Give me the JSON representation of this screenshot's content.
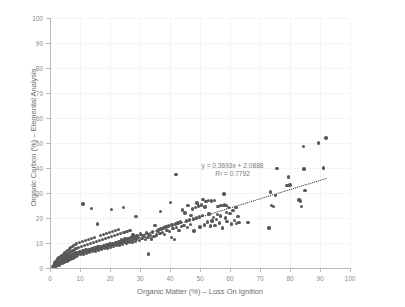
{
  "chart_data": {
    "type": "scatter",
    "title": "",
    "xlabel": "Organic Matter (%) – Loss On Ignition",
    "ylabel": "Organic Carbon (%) – Elemental Analysis",
    "xlim": [
      0,
      100
    ],
    "ylim": [
      0,
      100
    ],
    "xticks": [
      0,
      10,
      20,
      30,
      40,
      50,
      60,
      70,
      80,
      90,
      100
    ],
    "yticks": [
      0,
      10,
      20,
      30,
      40,
      50,
      60,
      70,
      80,
      90,
      100
    ],
    "grid": true,
    "legend": null,
    "point_color": "#585858",
    "trendline_color": "#222222",
    "annotation_color": "#7a7a7a",
    "axis_color": "#b8b8b8",
    "gridline_color": "#f4f4f4",
    "annotations": {
      "equation": "y = 0.3693x + 2.0888",
      "r_squared": "R² = 0.7792"
    },
    "fit": {
      "slope": 0.3693,
      "intercept": 2.0888,
      "r2": 0.7792,
      "x_start": 1.0,
      "x_end": 92.0
    },
    "points": [
      [
        1.0,
        0.6
      ],
      [
        1.2,
        0.9
      ],
      [
        1.4,
        1.4
      ],
      [
        1.5,
        0.4
      ],
      [
        1.6,
        2.0
      ],
      [
        1.8,
        1.1
      ],
      [
        1.9,
        2.6
      ],
      [
        2.0,
        0.8
      ],
      [
        2.1,
        1.9
      ],
      [
        2.2,
        3.1
      ],
      [
        2.3,
        1.3
      ],
      [
        2.4,
        2.4
      ],
      [
        2.5,
        0.9
      ],
      [
        2.6,
        3.6
      ],
      [
        2.7,
        2.0
      ],
      [
        2.8,
        1.5
      ],
      [
        2.9,
        4.0
      ],
      [
        3.0,
        2.6
      ],
      [
        3.1,
        1.1
      ],
      [
        3.2,
        3.3
      ],
      [
        3.3,
        2.1
      ],
      [
        3.4,
        4.4
      ],
      [
        3.5,
        1.7
      ],
      [
        3.6,
        2.9
      ],
      [
        3.7,
        3.8
      ],
      [
        3.8,
        2.3
      ],
      [
        3.9,
        5.0
      ],
      [
        4.0,
        3.2
      ],
      [
        4.1,
        1.9
      ],
      [
        4.2,
        4.1
      ],
      [
        4.3,
        2.7
      ],
      [
        4.4,
        5.4
      ],
      [
        4.5,
        3.5
      ],
      [
        4.6,
        2.2
      ],
      [
        4.7,
        4.6
      ],
      [
        4.8,
        3.0
      ],
      [
        4.9,
        6.0
      ],
      [
        5.0,
        3.9
      ],
      [
        5.1,
        2.5
      ],
      [
        5.2,
        5.1
      ],
      [
        5.3,
        3.4
      ],
      [
        5.4,
        6.6
      ],
      [
        5.5,
        4.2
      ],
      [
        5.6,
        2.8
      ],
      [
        5.7,
        5.5
      ],
      [
        5.8,
        3.7
      ],
      [
        5.9,
        7.1
      ],
      [
        6.0,
        4.5
      ],
      [
        6.1,
        3.1
      ],
      [
        6.2,
        5.9
      ],
      [
        6.3,
        4.0
      ],
      [
        6.4,
        7.6
      ],
      [
        6.5,
        4.8
      ],
      [
        6.6,
        3.4
      ],
      [
        6.7,
        6.3
      ],
      [
        6.8,
        4.3
      ],
      [
        6.9,
        8.1
      ],
      [
        7.0,
        5.1
      ],
      [
        7.1,
        3.7
      ],
      [
        7.2,
        6.7
      ],
      [
        7.3,
        4.6
      ],
      [
        7.4,
        8.5
      ],
      [
        7.5,
        5.4
      ],
      [
        7.6,
        4.0
      ],
      [
        7.7,
        7.1
      ],
      [
        7.8,
        4.9
      ],
      [
        7.9,
        9.0
      ],
      [
        8.0,
        5.7
      ],
      [
        8.1,
        4.3
      ],
      [
        8.2,
        7.5
      ],
      [
        8.3,
        5.2
      ],
      [
        8.4,
        9.4
      ],
      [
        8.5,
        6.0
      ],
      [
        8.6,
        4.6
      ],
      [
        8.7,
        7.9
      ],
      [
        8.8,
        5.5
      ],
      [
        8.9,
        9.8
      ],
      [
        9.0,
        6.3
      ],
      [
        9.2,
        5.0
      ],
      [
        9.4,
        8.3
      ],
      [
        9.6,
        5.9
      ],
      [
        9.8,
        10.2
      ],
      [
        10.0,
        6.6
      ],
      [
        10.2,
        5.3
      ],
      [
        10.4,
        8.7
      ],
      [
        10.6,
        6.2
      ],
      [
        10.8,
        10.6
      ],
      [
        11.0,
        6.9
      ],
      [
        11.0,
        25.6
      ],
      [
        11.2,
        5.6
      ],
      [
        11.4,
        9.1
      ],
      [
        11.6,
        6.5
      ],
      [
        11.8,
        11.0
      ],
      [
        12.0,
        7.2
      ],
      [
        12.2,
        5.9
      ],
      [
        12.4,
        9.5
      ],
      [
        12.6,
        6.8
      ],
      [
        12.8,
        11.4
      ],
      [
        13.0,
        7.5
      ],
      [
        13.2,
        6.2
      ],
      [
        13.4,
        9.9
      ],
      [
        13.6,
        7.1
      ],
      [
        13.8,
        11.8
      ],
      [
        13.8,
        23.9
      ],
      [
        14.0,
        7.8
      ],
      [
        14.2,
        6.5
      ],
      [
        14.4,
        10.3
      ],
      [
        14.6,
        7.4
      ],
      [
        14.8,
        12.2
      ],
      [
        15.0,
        8.1
      ],
      [
        15.2,
        6.8
      ],
      [
        15.4,
        10.7
      ],
      [
        15.6,
        7.7
      ],
      [
        15.8,
        17.6
      ],
      [
        16.0,
        8.4
      ],
      [
        16.2,
        7.1
      ],
      [
        16.4,
        11.1
      ],
      [
        16.6,
        8.0
      ],
      [
        16.8,
        13.0
      ],
      [
        17.0,
        8.7
      ],
      [
        17.2,
        7.4
      ],
      [
        17.4,
        11.5
      ],
      [
        17.6,
        8.3
      ],
      [
        17.8,
        13.4
      ],
      [
        18.0,
        9.0
      ],
      [
        18.2,
        7.7
      ],
      [
        18.4,
        11.9
      ],
      [
        18.6,
        8.6
      ],
      [
        18.8,
        13.8
      ],
      [
        19.0,
        9.3
      ],
      [
        19.2,
        8.0
      ],
      [
        19.4,
        12.3
      ],
      [
        19.6,
        8.9
      ],
      [
        19.8,
        14.2
      ],
      [
        20.0,
        9.6
      ],
      [
        20.2,
        8.3
      ],
      [
        20.4,
        12.7
      ],
      [
        20.5,
        23.3
      ],
      [
        20.6,
        9.2
      ],
      [
        20.8,
        14.6
      ],
      [
        21.0,
        9.9
      ],
      [
        21.2,
        8.6
      ],
      [
        21.4,
        13.1
      ],
      [
        21.6,
        9.5
      ],
      [
        21.8,
        15.0
      ],
      [
        22.0,
        10.2
      ],
      [
        22.2,
        8.9
      ],
      [
        22.4,
        13.5
      ],
      [
        22.6,
        9.8
      ],
      [
        22.8,
        15.4
      ],
      [
        23.0,
        10.5
      ],
      [
        23.2,
        9.2
      ],
      [
        23.4,
        13.9
      ],
      [
        23.6,
        10.1
      ],
      [
        23.8,
        11.3
      ],
      [
        24.0,
        10.8
      ],
      [
        24.2,
        9.5
      ],
      [
        24.4,
        24.2
      ],
      [
        24.6,
        14.3
      ],
      [
        24.8,
        10.4
      ],
      [
        25.0,
        11.6
      ],
      [
        25.2,
        11.1
      ],
      [
        25.4,
        9.8
      ],
      [
        25.6,
        14.7
      ],
      [
        25.8,
        10.7
      ],
      [
        26.0,
        11.9
      ],
      [
        26.2,
        11.4
      ],
      [
        26.4,
        10.1
      ],
      [
        26.6,
        15.1
      ],
      [
        26.8,
        11.0
      ],
      [
        27.0,
        12.2
      ],
      [
        27.2,
        11.7
      ],
      [
        27.4,
        10.4
      ],
      [
        27.6,
        13.2
      ],
      [
        27.8,
        11.3
      ],
      [
        28.0,
        12.5
      ],
      [
        28.2,
        12.0
      ],
      [
        28.4,
        10.7
      ],
      [
        28.6,
        20.7
      ],
      [
        28.8,
        11.6
      ],
      [
        29.0,
        12.8
      ],
      [
        29.4,
        12.3
      ],
      [
        29.8,
        11.0
      ],
      [
        30.2,
        13.6
      ],
      [
        30.6,
        11.9
      ],
      [
        31.0,
        13.1
      ],
      [
        31.4,
        12.6
      ],
      [
        31.8,
        11.3
      ],
      [
        32.2,
        14.0
      ],
      [
        32.6,
        12.2
      ],
      [
        32.8,
        5.6
      ],
      [
        33.0,
        13.4
      ],
      [
        33.4,
        12.9
      ],
      [
        33.8,
        11.6
      ],
      [
        34.2,
        14.4
      ],
      [
        34.6,
        12.5
      ],
      [
        35.0,
        16.9
      ],
      [
        35.4,
        13.2
      ],
      [
        35.8,
        14.8
      ],
      [
        36.2,
        15.2
      ],
      [
        36.6,
        13.9
      ],
      [
        36.8,
        22.6
      ],
      [
        37.0,
        15.6
      ],
      [
        37.4,
        14.2
      ],
      [
        37.8,
        16.0
      ],
      [
        38.2,
        13.5
      ],
      [
        38.6,
        16.4
      ],
      [
        39.0,
        15.0
      ],
      [
        39.4,
        16.8
      ],
      [
        39.8,
        14.5
      ],
      [
        40.2,
        26.3
      ],
      [
        40.4,
        12.1
      ],
      [
        40.6,
        17.2
      ],
      [
        41.0,
        15.8
      ],
      [
        41.4,
        11.4
      ],
      [
        41.8,
        17.6
      ],
      [
        42.0,
        37.3
      ],
      [
        42.2,
        16.2
      ],
      [
        42.6,
        18.0
      ],
      [
        43.0,
        15.1
      ],
      [
        43.4,
        18.4
      ],
      [
        43.8,
        16.6
      ],
      [
        44.2,
        23.2
      ],
      [
        44.6,
        17.0
      ],
      [
        45.0,
        22.0
      ],
      [
        45.4,
        18.8
      ],
      [
        45.8,
        16.1
      ],
      [
        46.0,
        25.1
      ],
      [
        46.4,
        19.2
      ],
      [
        46.8,
        17.4
      ],
      [
        47.0,
        20.9
      ],
      [
        47.4,
        23.6
      ],
      [
        47.8,
        19.6
      ],
      [
        48.0,
        14.8
      ],
      [
        48.4,
        24.3
      ],
      [
        48.8,
        20.0
      ],
      [
        49.0,
        26.0
      ],
      [
        49.4,
        24.8
      ],
      [
        49.8,
        20.4
      ],
      [
        50.0,
        16.4
      ],
      [
        50.4,
        25.2
      ],
      [
        50.8,
        21.0
      ],
      [
        51.0,
        27.4
      ],
      [
        51.4,
        17.2
      ],
      [
        51.6,
        24.4
      ],
      [
        52.0,
        26.6
      ],
      [
        52.4,
        18.4
      ],
      [
        52.8,
        27.0
      ],
      [
        53.0,
        21.6
      ],
      [
        53.4,
        16.8
      ],
      [
        53.8,
        26.8
      ],
      [
        54.0,
        18.8
      ],
      [
        54.4,
        20.2
      ],
      [
        54.8,
        26.9
      ],
      [
        55.0,
        17.0
      ],
      [
        55.4,
        19.4
      ],
      [
        55.8,
        21.4
      ],
      [
        56.0,
        24.6
      ],
      [
        56.4,
        18.0
      ],
      [
        56.8,
        20.8
      ],
      [
        57.0,
        25.0
      ],
      [
        57.4,
        16.0
      ],
      [
        57.8,
        24.9
      ],
      [
        58.0,
        29.6
      ],
      [
        58.2,
        25.2
      ],
      [
        58.4,
        20.0
      ],
      [
        58.6,
        25.0
      ],
      [
        58.8,
        22.2
      ],
      [
        59.0,
        18.6
      ],
      [
        59.4,
        24.2
      ],
      [
        60.0,
        21.8
      ],
      [
        60.4,
        17.6
      ],
      [
        61.0,
        23.0
      ],
      [
        61.4,
        19.0
      ],
      [
        62.0,
        24.2
      ],
      [
        62.2,
        17.8
      ],
      [
        62.6,
        20.6
      ],
      [
        63.0,
        18.2
      ],
      [
        66.0,
        18.2
      ],
      [
        73.0,
        16.0
      ],
      [
        73.4,
        30.4
      ],
      [
        73.8,
        25.0
      ],
      [
        74.4,
        24.6
      ],
      [
        75.2,
        29.0
      ],
      [
        75.6,
        39.8
      ],
      [
        79.0,
        33.0
      ],
      [
        79.4,
        36.4
      ],
      [
        80.0,
        33.2
      ],
      [
        83.0,
        27.2
      ],
      [
        83.4,
        26.8
      ],
      [
        83.8,
        24.6
      ],
      [
        84.4,
        48.5
      ],
      [
        84.6,
        39.6
      ],
      [
        85.0,
        31.0
      ],
      [
        89.5,
        50.0
      ],
      [
        91.2,
        40.0
      ],
      [
        92.0,
        52.0
      ]
    ]
  }
}
